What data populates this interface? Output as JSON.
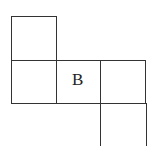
{
  "diagram": {
    "type": "cube-net",
    "squares": [
      {
        "id": "top-left",
        "label": ""
      },
      {
        "id": "middle-left",
        "label": ""
      },
      {
        "id": "middle-center",
        "label": "B"
      },
      {
        "id": "middle-right",
        "label": ""
      },
      {
        "id": "bottom-right",
        "label": ""
      }
    ]
  }
}
